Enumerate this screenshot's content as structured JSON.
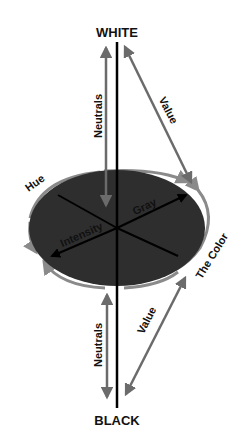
{
  "diagram": {
    "poles": {
      "top": "WHITE",
      "bottom": "BLACK"
    },
    "labels": {
      "neutrals_top": "Neutrals",
      "neutrals_bottom": "Neutrals",
      "value_top": "Value",
      "value_bottom": "Value",
      "hue": "Hue",
      "the_color": "The Color",
      "intensity": "Intensity",
      "gray": "Gray"
    },
    "colors": {
      "background": "#ffffff",
      "disc_fill": "#2e2e2e",
      "axis_line": "#000000",
      "arrow_gray": "#6b6b6b",
      "ring_gray": "#8a8a8a",
      "text": "#111111"
    }
  }
}
